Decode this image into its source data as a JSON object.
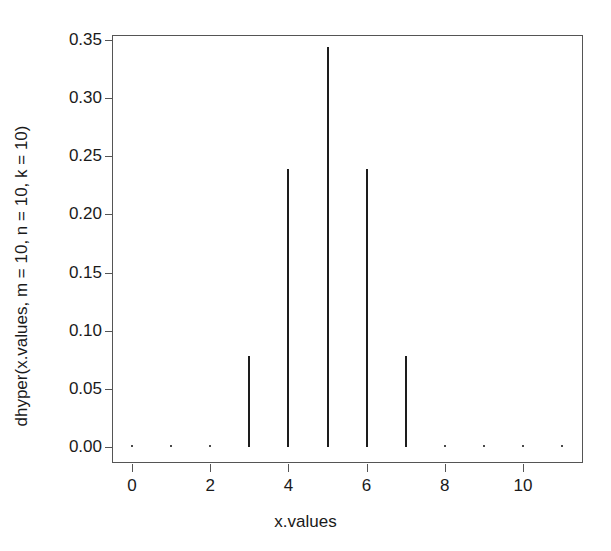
{
  "chart_data": {
    "type": "bar",
    "subtype": "spike-plot",
    "title": "",
    "xlabel": "x.values",
    "ylabel": "dhyper(x.values, m = 10, n = 10, k = 10)",
    "x": [
      0,
      1,
      2,
      3,
      4,
      5,
      6,
      7,
      8,
      9,
      10,
      11
    ],
    "values": [
      0.0,
      5.4e-06,
      0.001353,
      0.077935,
      0.238715,
      0.343794,
      0.238715,
      0.077935,
      0.001353,
      5.4e-06,
      0.0,
      0.0
    ],
    "categories": [
      "0",
      "1",
      "2",
      "3",
      "4",
      "5",
      "6",
      "7",
      "8",
      "9",
      "10",
      "11"
    ],
    "xlim": [
      -0.5,
      11.5
    ],
    "ylim": [
      0.0,
      0.3583
    ],
    "xticks": [
      0,
      2,
      4,
      6,
      8,
      10
    ],
    "xtick_labels": [
      "0",
      "2",
      "4",
      "6",
      "8",
      "10"
    ],
    "yticks": [
      0.0,
      0.05,
      0.1,
      0.15,
      0.2,
      0.25,
      0.3,
      0.35
    ],
    "ytick_labels": [
      "0.00",
      "0.05",
      "0.10",
      "0.15",
      "0.20",
      "0.25",
      "0.30",
      "0.35"
    ],
    "grid": false,
    "legend": false,
    "series_color": "#1d1d1d",
    "frame_color": "#555555",
    "background": "#ffffff"
  }
}
